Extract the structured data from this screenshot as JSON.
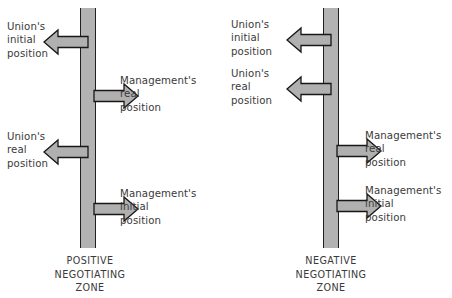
{
  "figure": {
    "colors": {
      "spine_fill": "#b3b3b3",
      "spine_stroke": "#1f1f1f",
      "arrow_fill": "#b0b0b0",
      "arrow_stroke": "#171717",
      "text": "#3a3a3a",
      "background": "#ffffff"
    }
  },
  "panels": [
    {
      "id": "positive",
      "caption": "POSITIVE\nNEGOTIATING\nZONE",
      "caption_lines": [
        "POSITIVE",
        "NEGOTIATING",
        "ZONE"
      ],
      "labels": [
        {
          "id": "union-initial",
          "text": "Union's\ninitial\nposition",
          "lines": [
            "Union's",
            "initial",
            "position"
          ],
          "direction": "left"
        },
        {
          "id": "management-real",
          "text": "Management's\nreal\nposition",
          "lines": [
            "Management's",
            "real",
            "position"
          ],
          "direction": "right"
        },
        {
          "id": "union-real",
          "text": "Union's\nreal\nposition",
          "lines": [
            "Union's",
            "real",
            "position"
          ],
          "direction": "left"
        },
        {
          "id": "management-initial",
          "text": "Management's\ninitial\nposition",
          "lines": [
            "Management's",
            "initial",
            "position"
          ],
          "direction": "right"
        }
      ]
    },
    {
      "id": "negative",
      "caption": "NEGATIVE\nNEGOTIATING\nZONE",
      "caption_lines": [
        "NEGATIVE",
        "NEGOTIATING",
        "ZONE"
      ],
      "labels": [
        {
          "id": "union-initial",
          "text": "Union's\ninitial\nposition",
          "lines": [
            "Union's",
            "initial",
            "position"
          ],
          "direction": "left"
        },
        {
          "id": "union-real",
          "text": "Union's\nreal\nposition",
          "lines": [
            "Union's",
            "real",
            "position"
          ],
          "direction": "left"
        },
        {
          "id": "management-real",
          "text": "Management's\nreal\nposition",
          "lines": [
            "Management's",
            "real",
            "position"
          ],
          "direction": "right"
        },
        {
          "id": "management-initial",
          "text": "Management's\ninitial\nposition",
          "lines": [
            "Management's",
            "initial",
            "position"
          ],
          "direction": "right"
        }
      ]
    }
  ]
}
